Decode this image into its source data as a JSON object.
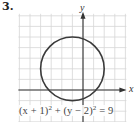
{
  "problem_number": "3.",
  "axes": {
    "x_label": "x",
    "y_label": "y"
  },
  "equation": {
    "part1": "(x + 1)",
    "exp1": "2",
    "part2": " + (y − 2)",
    "exp2": "2",
    "part3": " = 9"
  },
  "diagram": {
    "type": "circle-on-grid",
    "center": [
      -1,
      2
    ],
    "radius": 3,
    "grid": {
      "x_range": [
        -6,
        4
      ],
      "y_range": [
        -2,
        7
      ],
      "unit_px": 10.6
    },
    "colors": {
      "grid": "#d6d6d6",
      "axis": "#333333",
      "circle": "#3a3a3a"
    }
  }
}
